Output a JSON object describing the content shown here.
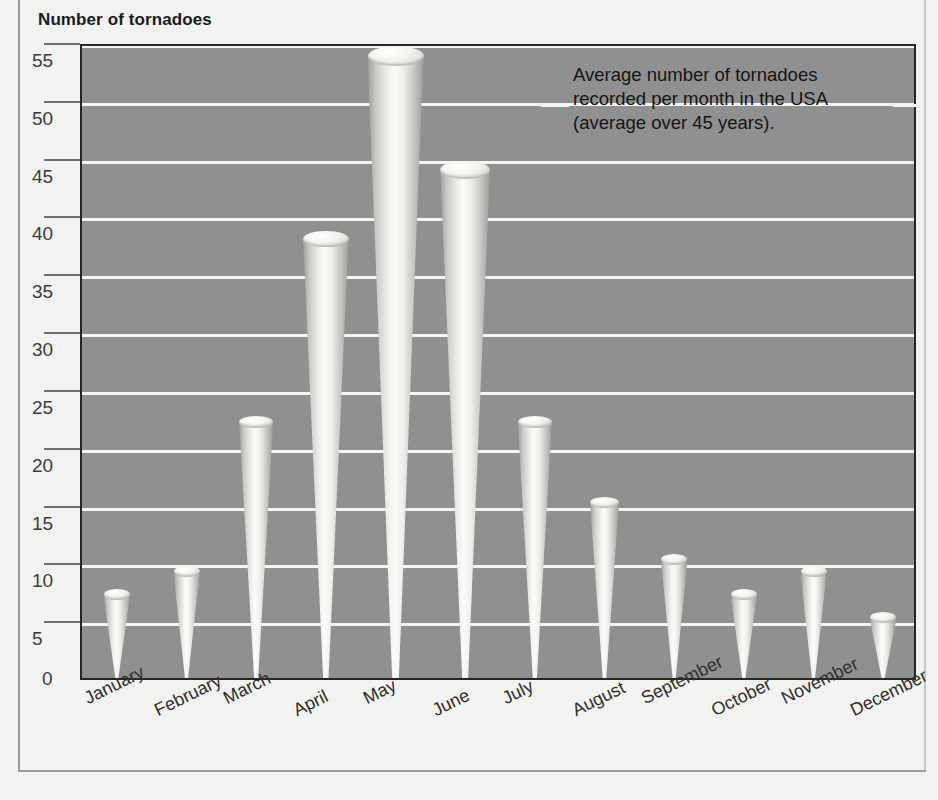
{
  "page": {
    "heading": "Number of tornadoes",
    "clipped_partial_line": "",
    "background_color": "#f2f2f0",
    "plot_background_color": "#909090",
    "gridline_color": "#f4f4f4",
    "bar_color": "#ededea"
  },
  "annotation": {
    "lines": [
      "Average number of tornadoes",
      "recorded per month in the USA",
      "(average over 45 years)."
    ]
  },
  "chart_data": {
    "type": "bar",
    "title": "Number of tornadoes",
    "subtitle": "Average number of tornadoes recorded per month in the USA (average over 45 years).",
    "xlabel": "",
    "ylabel": "Number of tornadoes",
    "categories": [
      "January",
      "February",
      "March",
      "April",
      "May",
      "June",
      "July",
      "August",
      "September",
      "October",
      "November",
      "December"
    ],
    "values": [
      7,
      9,
      22,
      38,
      54,
      44,
      22,
      15,
      10,
      7,
      9,
      5
    ],
    "ylim": [
      0,
      55
    ],
    "yticks": [
      0,
      5,
      10,
      15,
      20,
      25,
      30,
      35,
      40,
      45,
      50,
      55
    ],
    "ytick_labels": [
      "0",
      "5",
      "10",
      "15",
      "20",
      "25",
      "30",
      "35",
      "40",
      "45",
      "50",
      "55"
    ],
    "grid": true,
    "grid_axis": "y",
    "legend": false,
    "bar_style": "3d-cone",
    "annotations": [
      {
        "text": "Average number of tornadoes recorded per month in the USA (average over 45 years).",
        "position": "upper-right"
      }
    ]
  }
}
